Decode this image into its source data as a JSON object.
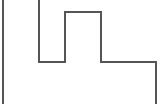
{
  "canvas": {
    "width": 162,
    "height": 104,
    "background_color": "#ffffff",
    "description": "stepped-outline-figure"
  },
  "figure": {
    "name": "stepped-polyline-outline",
    "stroke_color": "#555555",
    "stroke_width": 1.6,
    "fill": "none",
    "closed": false,
    "path_commands": "M 3 0 L 3 104 M 3 0 M 39 0 L 39 62 L 65 62 L 65 12 L 101 12 L 101 62 L 156 62 L 156 104",
    "vertices": [
      {
        "name": "left-wall-top",
        "x": 3,
        "y": 0
      },
      {
        "name": "left-wall-bottom",
        "x": 3,
        "y": 104
      },
      {
        "name": "inner-left-top",
        "x": 39,
        "y": 0
      },
      {
        "name": "inner-left-bottom",
        "x": 39,
        "y": 62
      },
      {
        "name": "valley-floor-right",
        "x": 65,
        "y": 62
      },
      {
        "name": "tower-left-top",
        "x": 65,
        "y": 12
      },
      {
        "name": "tower-right-top",
        "x": 101,
        "y": 12
      },
      {
        "name": "tower-right-bottom",
        "x": 101,
        "y": 62
      },
      {
        "name": "ledge-right",
        "x": 156,
        "y": 62
      },
      {
        "name": "right-wall-bottom",
        "x": 156,
        "y": 104
      }
    ],
    "segments": [
      {
        "name": "left-outer-wall",
        "orientation": "vertical",
        "x": 3,
        "y1": 0,
        "y2": 104
      },
      {
        "name": "inner-left-wall",
        "orientation": "vertical",
        "x": 39,
        "y1": 0,
        "y2": 62
      },
      {
        "name": "valley-floor",
        "orientation": "horizontal",
        "y": 62,
        "x1": 39,
        "x2": 65
      },
      {
        "name": "tower-left-wall",
        "orientation": "vertical",
        "x": 65,
        "y1": 12,
        "y2": 62
      },
      {
        "name": "tower-top",
        "orientation": "horizontal",
        "y": 12,
        "x1": 65,
        "x2": 101
      },
      {
        "name": "tower-right-wall",
        "orientation": "vertical",
        "x": 101,
        "y1": 12,
        "y2": 62
      },
      {
        "name": "right-ledge",
        "orientation": "horizontal",
        "y": 62,
        "x1": 101,
        "x2": 156
      },
      {
        "name": "right-outer-wall",
        "orientation": "vertical",
        "x": 156,
        "y1": 62,
        "y2": 104
      }
    ]
  }
}
